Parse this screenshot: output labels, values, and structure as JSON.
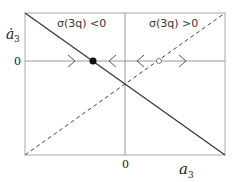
{
  "diagram": {
    "type": "phase-line",
    "y_axis_label": "ȧ",
    "y_axis_label_sub": "3",
    "x_axis_label": "a",
    "x_axis_label_sub": "3",
    "y_zero_tick": "0",
    "x_zero_tick": "0",
    "region_left_label": "σ(3q) <0",
    "region_right_label": "σ(3q) >0",
    "lines": [
      {
        "name": "solid-line",
        "style": "solid",
        "from": [
          25,
          13
        ],
        "to": [
          225,
          155
        ],
        "condition": "σ(3q) < 0"
      },
      {
        "name": "dashed-line",
        "style": "dashed",
        "from": [
          25,
          155
        ],
        "to": [
          225,
          13
        ],
        "condition": "σ(3q) > 0"
      }
    ],
    "fixed_points": [
      {
        "name": "stable-fixed-point",
        "style": "filled",
        "x": 93,
        "y": 61
      },
      {
        "name": "unstable-fixed-point",
        "style": "open",
        "x": 159,
        "y": 61
      }
    ],
    "arrows": [
      {
        "name": "arrow-right-left-segment",
        "direction": "right",
        "x": 72
      },
      {
        "name": "arrow-left-middle-segment",
        "direction": "left",
        "x": 112
      },
      {
        "name": "arrow-left-right-segment",
        "direction": "left",
        "x": 140
      },
      {
        "name": "arrow-right-far-segment",
        "direction": "right",
        "x": 182
      }
    ],
    "colors": {
      "line": "#333333",
      "axis": "#999999",
      "frame": "#aaaaaa"
    }
  }
}
